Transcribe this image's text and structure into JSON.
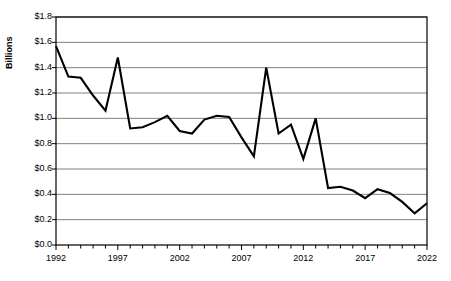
{
  "chart_data": {
    "type": "line",
    "title": "",
    "xlabel": "",
    "ylabel": "Billions",
    "ylim": [
      0.0,
      1.8
    ],
    "xlim": [
      1992,
      2022
    ],
    "grid": "horizontal",
    "legend": "none",
    "line_color": "#000000",
    "grid_color": "#808080",
    "axis_color": "#000000",
    "background_color": "#ffffff",
    "ytick_labels": [
      "$1.8",
      "$1.6",
      "$1.4",
      "$1.2",
      "$1.0",
      "$0.8",
      "$0.6",
      "$0.4",
      "$0.2",
      "$0.0"
    ],
    "ytick_values": [
      1.8,
      1.6,
      1.4,
      1.2,
      1.0,
      0.8,
      0.6,
      0.4,
      0.2,
      0.0
    ],
    "xtick_labels": [
      "1992",
      "1997",
      "2002",
      "2007",
      "2012",
      "2017",
      "2022"
    ],
    "xtick_values": [
      1992,
      1997,
      2002,
      2007,
      2012,
      2017,
      2022
    ],
    "x": [
      1992,
      1993,
      1994,
      1995,
      1996,
      1997,
      1998,
      1999,
      2000,
      2001,
      2002,
      2003,
      2004,
      2005,
      2006,
      2007,
      2008,
      2009,
      2010,
      2011,
      2012,
      2013,
      2014,
      2015,
      2016,
      2017,
      2018,
      2019,
      2020,
      2021,
      2022
    ],
    "categories": [
      "1992",
      "1993",
      "1994",
      "1995",
      "1996",
      "1997",
      "1998",
      "1999",
      "2000",
      "2001",
      "2002",
      "2003",
      "2004",
      "2005",
      "2006",
      "2007",
      "2008",
      "2009",
      "2010",
      "2011",
      "2012",
      "2013",
      "2014",
      "2015",
      "2016",
      "2017",
      "2018",
      "2019",
      "2020",
      "2021",
      "2022"
    ],
    "values": [
      1.57,
      1.33,
      1.32,
      1.18,
      1.06,
      1.48,
      0.92,
      0.93,
      0.97,
      1.02,
      0.9,
      0.88,
      0.99,
      1.02,
      1.01,
      0.85,
      0.7,
      1.4,
      0.88,
      0.95,
      0.68,
      1.0,
      0.45,
      0.46,
      0.43,
      0.37,
      0.44,
      0.41,
      0.34,
      0.25,
      0.33
    ],
    "series": [
      {
        "name": "",
        "values": [
          1.57,
          1.33,
          1.32,
          1.18,
          1.06,
          1.48,
          0.92,
          0.93,
          0.97,
          1.02,
          0.9,
          0.88,
          0.99,
          1.02,
          1.01,
          0.85,
          0.7,
          1.4,
          0.88,
          0.95,
          0.68,
          1.0,
          0.45,
          0.46,
          0.43,
          0.37,
          0.44,
          0.41,
          0.34,
          0.25,
          0.33
        ]
      }
    ]
  }
}
